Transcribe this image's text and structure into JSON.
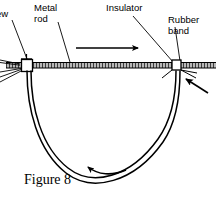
{
  "figure": {
    "caption": "Figure 8",
    "background_color": "#ffffff",
    "line_color": "#000000",
    "rod_fill_color": "#6b6b6b"
  },
  "labels": {
    "screw": "ew",
    "metal_rod": "Metal\nrod",
    "metal_rod_line1": "Metal",
    "metal_rod_line2": "rod",
    "insulator": "Insulator",
    "rubber_band_line1": "Rubber",
    "rubber_band_line2": "band"
  },
  "annotations": {
    "rod_direction_arrow": "arrow-right",
    "loop_direction_arrow": "arrow-curved-left",
    "band_pull_arrow": "arrow-up-left"
  },
  "components": {
    "metal_rod": "horizontal-hatched-rod",
    "screw_block": "square-clamp-left",
    "insulator_block": "square-clamp-right",
    "rubber_band_loop": "u-shaped-double-line-loop"
  }
}
